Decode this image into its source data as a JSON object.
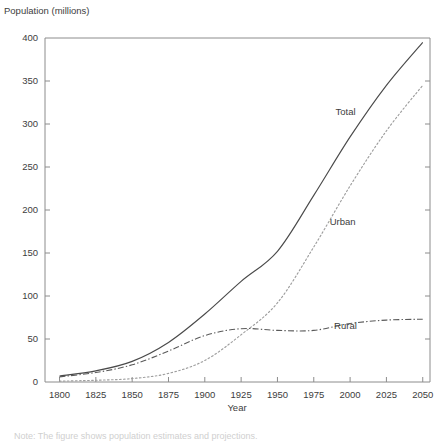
{
  "chart_data": {
    "type": "line",
    "title": "Population (millions)",
    "xlabel": "Year",
    "ylabel": "Population (millions)",
    "xlim": [
      1790,
      2055
    ],
    "ylim": [
      0,
      400
    ],
    "yticks": [
      0,
      50,
      100,
      150,
      200,
      250,
      300,
      350,
      400
    ],
    "xticks": [
      1800,
      1825,
      1850,
      1875,
      1900,
      1925,
      1950,
      1975,
      2000,
      2025,
      2050
    ],
    "grid": false,
    "legend": "inline-annotations",
    "x": [
      1800,
      1825,
      1850,
      1875,
      1900,
      1925,
      1950,
      1975,
      2000,
      2025,
      2050
    ],
    "series": [
      {
        "name": "Total",
        "style": "solid",
        "color": "#4a4a4a",
        "values": [
          7,
          13,
          24,
          46,
          79,
          117,
          152,
          217,
          285,
          345,
          395
        ]
      },
      {
        "name": "Urban",
        "style": "dotted",
        "color": "#9e9e9e",
        "values": [
          1,
          2,
          4,
          10,
          25,
          55,
          92,
          157,
          228,
          292,
          345
        ]
      },
      {
        "name": "Rural",
        "style": "dash-dot",
        "color": "#5a5a5a",
        "values": [
          6,
          11,
          20,
          36,
          54,
          62,
          60,
          60,
          68,
          72,
          73
        ]
      }
    ],
    "annotations": [
      {
        "text": "Total",
        "x": 1990,
        "y": 310
      },
      {
        "text": "Urban",
        "x": 1986,
        "y": 182
      },
      {
        "text": "Rural",
        "x": 1989,
        "y": 62
      }
    ]
  },
  "axes": {
    "y_tick_labels": [
      "400",
      "350",
      "300",
      "250",
      "200",
      "150",
      "100",
      "50",
      "0"
    ],
    "x_tick_labels": [
      "1800",
      "1825",
      "1850",
      "1875",
      "1900",
      "1925",
      "1950",
      "1975",
      "2000",
      "2025",
      "2050"
    ],
    "y_axis_title": "Population (millions)",
    "x_axis_title": "Year"
  },
  "footer": {
    "cutoff_text": "Note: The figure shows population estimates and projections."
  }
}
